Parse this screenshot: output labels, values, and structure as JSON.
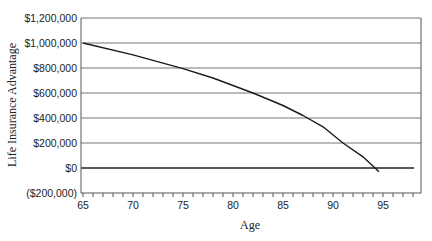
{
  "chart_data": {
    "type": "line",
    "title": "",
    "xlabel": "Age",
    "ylabel": "Life Insurance Advantage",
    "xlim": [
      65,
      98.8
    ],
    "ylim": [
      -200000,
      1200000
    ],
    "grid": {
      "horizontal": true,
      "vertical": false
    },
    "legend": null,
    "x_tick_labels": [
      "65",
      "70",
      "75",
      "80",
      "85",
      "90",
      "95"
    ],
    "x_ticks": [
      65,
      70,
      75,
      80,
      85,
      90,
      95
    ],
    "x_minor_tick_step": 1,
    "y_tick_labels": [
      "$1,200,000",
      "$1,000,000",
      "$800,000",
      "$600,000",
      "$400,000",
      "$200,000",
      "$0",
      "($200,000)"
    ],
    "y_ticks": [
      1200000,
      1000000,
      800000,
      600000,
      400000,
      200000,
      0,
      -200000
    ],
    "series": [
      {
        "name": "Life Insurance Advantage",
        "color": "#1a1a1a",
        "x": [
          65,
          70,
          75,
          78,
          82,
          85,
          87,
          89,
          91,
          93,
          94.2,
          94.6
        ],
        "values": [
          1000000,
          905000,
          795000,
          720000,
          600000,
          500000,
          420000,
          330000,
          200000,
          90000,
          0,
          -30000
        ]
      }
    ],
    "zero_line": true
  },
  "colors": {
    "gridline": "#777777",
    "axis": "#555555",
    "zero_line": "#222222",
    "curve": "#1a1a1a"
  }
}
